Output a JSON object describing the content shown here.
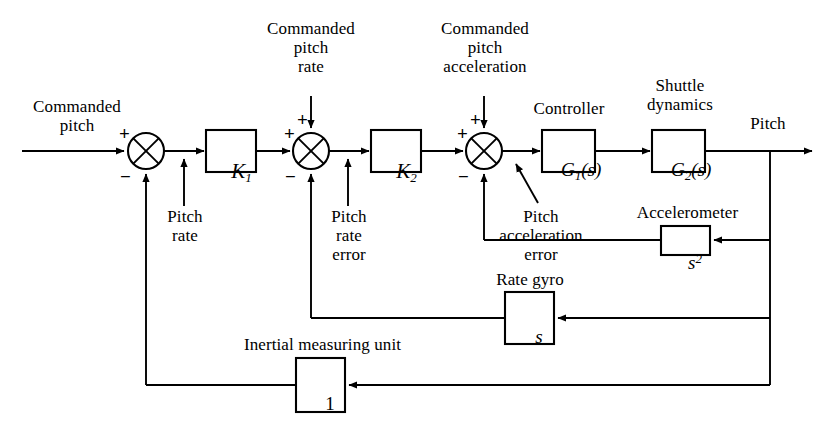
{
  "figure": {
    "type": "control-block-diagram",
    "line_color": "#000000",
    "background": "#ffffff"
  },
  "signals": {
    "input_label": "Commanded\npitch",
    "output_label": "Pitch",
    "commanded_pitch_rate": "Commanded\npitch\nrate",
    "commanded_pitch_acceleration": "Commanded\npitch\nacceleration",
    "pitch_rate_tap": "Pitch\nrate",
    "pitch_rate_error": "Pitch\nrate\nerror",
    "pitch_acceleration_error": "Pitch\nacceleration\nerror"
  },
  "blocks": [
    {
      "id": "k1",
      "label": "K",
      "subscript": "1",
      "caption": "",
      "x": 206,
      "y": 130,
      "w": 50,
      "h": 42
    },
    {
      "id": "k2",
      "label": "K",
      "subscript": "2",
      "caption": "",
      "x": 371,
      "y": 130,
      "w": 50,
      "h": 42
    },
    {
      "id": "g1",
      "label": "G",
      "subscript": "1",
      "suffix": "(s)",
      "caption": "Controller",
      "x": 542,
      "y": 130,
      "w": 53,
      "h": 42
    },
    {
      "id": "g2",
      "label": "G",
      "subscript": "2",
      "suffix": "(s)",
      "caption": "Shuttle\ndynamics",
      "x": 652,
      "y": 130,
      "w": 53,
      "h": 42
    },
    {
      "id": "accelerometer",
      "label": "s",
      "superscript": "2",
      "caption": "Accelerometer",
      "x": 661,
      "y": 226,
      "w": 49,
      "h": 29
    },
    {
      "id": "rate-gyro",
      "label": "s",
      "caption": "Rate gyro",
      "x": 505,
      "y": 292,
      "w": 49,
      "h": 52
    },
    {
      "id": "imu",
      "label": "1",
      "caption": "Inertial measuring unit",
      "x": 296,
      "y": 358,
      "w": 49,
      "h": 54
    }
  ],
  "summing_junctions": [
    {
      "id": "sum1",
      "cx": 146,
      "cy": 151,
      "r": 18,
      "signs": {
        "left": "+",
        "bottom": "−"
      }
    },
    {
      "id": "sum2",
      "cx": 311,
      "cy": 151,
      "r": 18,
      "signs": {
        "left": "+",
        "top": "+",
        "bottom": "−"
      }
    },
    {
      "id": "sum3",
      "cx": 484,
      "cy": 151,
      "r": 18,
      "signs": {
        "left": "+",
        "top": "+",
        "bottom": "−"
      }
    }
  ],
  "captions": {
    "controller": "Controller",
    "shuttle_dynamics": "Shuttle\ndynamics",
    "accelerometer": "Accelerometer",
    "rate_gyro": "Rate gyro",
    "inertial_measuring_unit": "Inertial measuring unit"
  },
  "block_labels": {
    "k1_base": "K",
    "k1_sub": "1",
    "k2_base": "K",
    "k2_sub": "2",
    "g1_base": "G",
    "g1_sub": "1",
    "g1_suffix": "(s)",
    "g2_base": "G",
    "g2_sub": "2",
    "g2_suffix": "(s)",
    "accel_base": "s",
    "accel_sup": "2",
    "gyro_base": "s",
    "imu_base": "1"
  },
  "signs": {
    "plus": "+",
    "minus": "−"
  },
  "geometry": {
    "main_line_y": 151,
    "output_tap_x": 770,
    "accel_feedback_y": 240,
    "gyro_feedback_y": 318,
    "imu_feedback_y": 385,
    "sum1_feedback_x": 146,
    "sum2_feedback_x": 311,
    "sum3_feedback_x": 484
  }
}
